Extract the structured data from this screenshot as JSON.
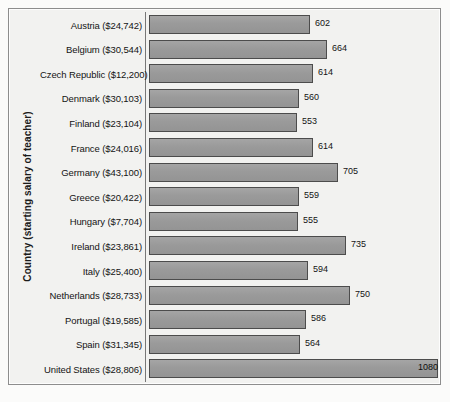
{
  "chart_data": {
    "type": "bar",
    "orientation": "horizontal",
    "title": "",
    "subtitle": "",
    "xlabel": "",
    "ylabel": "Country (starting salary of teacher)",
    "grid": false,
    "legend": null,
    "xlim": [
      0,
      1080
    ],
    "value_labels_shown": true,
    "categories": [
      "Austria ($24,742)",
      "Belgium ($30,544)",
      "Czech Republic ($12,200)",
      "Denmark ($30,103)",
      "Finland ($23,104)",
      "France ($24,016)",
      "Germany ($43,100)",
      "Greece ($20,422)",
      "Hungary ($7,704)",
      "Ireland ($23,861)",
      "Italy ($25,400)",
      "Netherlands ($28,733)",
      "Portugal ($19,585)",
      "Spain ($31,345)",
      "United States ($28,806)"
    ],
    "values": [
      602,
      664,
      614,
      560,
      553,
      614,
      705,
      559,
      555,
      735,
      594,
      750,
      586,
      564,
      1080
    ],
    "value_label_position": [
      "outside",
      "outside",
      "outside",
      "outside",
      "outside",
      "outside",
      "outside",
      "outside",
      "outside",
      "outside",
      "outside",
      "outside",
      "outside",
      "outside",
      "inside"
    ],
    "colors": {
      "bar_fill": "#9a9a9a",
      "bar_border": "#4c4c4c",
      "plot_background": "#f2f2f0",
      "frame_border": "#8d8d8d",
      "text": "#141414",
      "page_background": "#fbfbfa"
    }
  }
}
